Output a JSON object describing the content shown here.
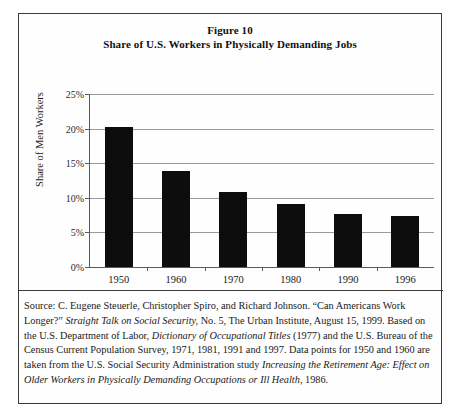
{
  "figure": {
    "title_line1": "Figure 10",
    "title_line2": "Share of U.S. Workers in Physically Demanding Jobs"
  },
  "chart_data": {
    "type": "bar",
    "title": "Share of U.S. Workers in Physically Demanding Jobs",
    "subtitle": "Figure 10",
    "xlabel": "",
    "ylabel": "Share of Men Workers",
    "categories": [
      "1950",
      "1960",
      "1970",
      "1980",
      "1990",
      "1996"
    ],
    "values": [
      20.3,
      13.9,
      10.8,
      9.1,
      7.7,
      7.4
    ],
    "ylim": [
      0,
      25
    ],
    "ytick_labels": [
      "0%",
      "5%",
      "10%",
      "15%",
      "20%",
      "25%"
    ],
    "ytick_values": [
      0,
      5,
      10,
      15,
      20,
      25
    ],
    "grid": true,
    "legend": "none",
    "bar_color": "#0d0d0d"
  },
  "source": {
    "prefix": "Source: C. Eugene Steuerle, Christopher Spiro, and Richard Johnson. “Can Americans Work Longer?” ",
    "italic1": "Straight Talk on Social Security,",
    "mid1": " No. 5, The Urban Institute, August 15, 1999. Based on the U.S. Department of Labor, ",
    "italic2": "Dictionary of Occupational Titles",
    "mid2": " (1977) and the U.S. Bureau of the Census Current Population Survey, 1971, 1981, 1991 and 1997. Data points for 1950 and 1960 are taken from the U.S. Social Security Administration study ",
    "italic3": "Increasing the Retirement Age: Effect on Older Workers in Physically Demanding Occupations or Ill Health,",
    "suffix": " 1986."
  }
}
